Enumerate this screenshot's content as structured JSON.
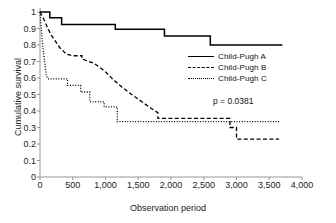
{
  "chart_data": {
    "type": "line",
    "title": "",
    "subtitle": "",
    "xlabel": "Observation period",
    "ylabel": "Cumulative survival",
    "xlim": [
      0,
      4000
    ],
    "ylim": [
      0,
      1
    ],
    "grid": false,
    "legend_position": "upper-right-inside",
    "annotations": [
      {
        "name": "p-value",
        "text": "p = 0.0381",
        "x": 2350,
        "y": 0.47
      }
    ],
    "xticks": [
      0,
      500,
      1000,
      1500,
      2000,
      2500,
      3000,
      3500,
      4000
    ],
    "xticklabels": [
      "0",
      "500",
      "1,000",
      "1,500",
      "2,000",
      "2,500",
      "3,000",
      "3,500",
      "4,000"
    ],
    "yticks": [
      0,
      0.1,
      0.2,
      0.3,
      0.4,
      0.5,
      0.6,
      0.7,
      0.8,
      0.9,
      1
    ],
    "yticklabels": [
      "0",
      "0.1",
      "0.2",
      "0.3",
      "0.4",
      "0.5",
      "0.6",
      "0.7",
      "0.8",
      "0.9",
      "1"
    ],
    "series": [
      {
        "name": "Child-Pugh A",
        "style": "solid",
        "color": "#000000",
        "points": [
          [
            0,
            1.0
          ],
          [
            150,
            1.0
          ],
          [
            150,
            0.965
          ],
          [
            330,
            0.965
          ],
          [
            330,
            0.925
          ],
          [
            1150,
            0.925
          ],
          [
            1150,
            0.895
          ],
          [
            1900,
            0.895
          ],
          [
            1900,
            0.855
          ],
          [
            2600,
            0.855
          ],
          [
            2600,
            0.8
          ],
          [
            3700,
            0.8
          ]
        ]
      },
      {
        "name": "Child-Pugh B",
        "style": "dashed",
        "color": "#000000",
        "points": [
          [
            0,
            1.0
          ],
          [
            60,
            0.955
          ],
          [
            120,
            0.9
          ],
          [
            180,
            0.855
          ],
          [
            240,
            0.82
          ],
          [
            300,
            0.785
          ],
          [
            400,
            0.745
          ],
          [
            500,
            0.735
          ],
          [
            640,
            0.735
          ],
          [
            640,
            0.715
          ],
          [
            820,
            0.69
          ],
          [
            980,
            0.645
          ],
          [
            1120,
            0.59
          ],
          [
            1250,
            0.545
          ],
          [
            1400,
            0.5
          ],
          [
            1560,
            0.455
          ],
          [
            1700,
            0.415
          ],
          [
            1800,
            0.39
          ],
          [
            1800,
            0.355
          ],
          [
            2900,
            0.355
          ],
          [
            2900,
            0.3
          ],
          [
            3000,
            0.3
          ],
          [
            3000,
            0.23
          ],
          [
            3650,
            0.23
          ]
        ]
      },
      {
        "name": "Child-Pugh C",
        "style": "dotted",
        "color": "#000000",
        "points": [
          [
            0,
            1.0
          ],
          [
            40,
            0.8
          ],
          [
            70,
            0.7
          ],
          [
            95,
            0.62
          ],
          [
            120,
            0.595
          ],
          [
            420,
            0.595
          ],
          [
            420,
            0.555
          ],
          [
            620,
            0.555
          ],
          [
            620,
            0.515
          ],
          [
            760,
            0.515
          ],
          [
            760,
            0.455
          ],
          [
            980,
            0.455
          ],
          [
            980,
            0.425
          ],
          [
            1180,
            0.425
          ],
          [
            1180,
            0.335
          ],
          [
            3650,
            0.335
          ]
        ]
      }
    ]
  },
  "legend": {
    "items": [
      {
        "label": "Child-Pugh A",
        "style": "solid"
      },
      {
        "label": "Child-Pugh B",
        "style": "dashed"
      },
      {
        "label": "Child-Pugh C",
        "style": "dotted"
      }
    ]
  },
  "pvalue": {
    "text": "p = 0.0381"
  }
}
